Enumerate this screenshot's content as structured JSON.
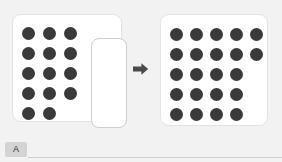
{
  "canvas": {
    "width": 282,
    "height": 162,
    "background_color": "#f2f2f2"
  },
  "colors": {
    "dot": "#3a3a3a",
    "panel_background": "#ffffff",
    "panel_border": "#e3e3e3",
    "selection_border": "#cfcfcf",
    "arrow": "#4a4a4a",
    "tab_background": "#d4d4d4",
    "rule": "#d0d0d0"
  },
  "left_panel": {
    "name": "before-state",
    "total_dots": 14,
    "columns": 3,
    "rows": [
      3,
      3,
      3,
      3,
      2
    ],
    "selection_box": {
      "label": "empty-selection-region",
      "visible": true
    }
  },
  "arrow": {
    "direction": "right",
    "icon": "arrow-right-icon"
  },
  "right_panel": {
    "name": "after-state",
    "total_dots": 22,
    "columns": 5,
    "rows": [
      5,
      5,
      4,
      4,
      4
    ]
  },
  "bottom_bar": {
    "ime_tab": {
      "icon": "ime-indicator-icon",
      "label": "A"
    },
    "rule_visible": true
  }
}
